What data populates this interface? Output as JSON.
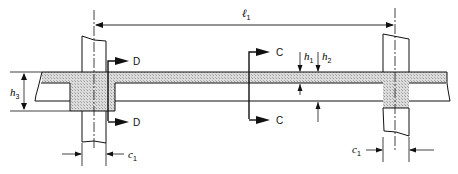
{
  "diagram": {
    "title": "",
    "colors": {
      "line": "#111111",
      "hatch": "#d6d6d6",
      "background": "#ffffff"
    },
    "labels": {
      "span": {
        "symbol": "ℓ",
        "sub": "1"
      },
      "h1": {
        "symbol": "h",
        "sub": "1"
      },
      "h2": {
        "symbol": "h",
        "sub": "2"
      },
      "h3": {
        "symbol": "h",
        "sub": "3"
      },
      "c1_left": {
        "symbol": "c",
        "sub": "1"
      },
      "c1_right": {
        "symbol": "c",
        "sub": "1"
      },
      "section_c_top": "C",
      "section_c_bottom": "C",
      "section_d_top": "D",
      "section_d_bottom": "D"
    },
    "elements": [
      "left-column",
      "right-column",
      "slab",
      "left-drop-panel",
      "right-drop-panel",
      "section-cut-C",
      "section-cut-D",
      "dimension-l1",
      "dimension-h1",
      "dimension-h2",
      "dimension-h3",
      "dimension-c1-left",
      "dimension-c1-right"
    ]
  }
}
